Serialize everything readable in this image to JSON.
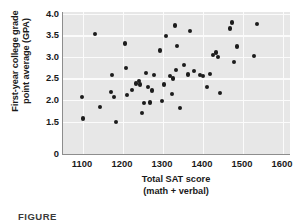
{
  "chart_data": {
    "type": "scatter",
    "title": "",
    "xlabel": "Total SAT score (math + verbal)",
    "xlabel_line1": "Total SAT score",
    "xlabel_line2": "(math + verbal)",
    "ylabel": "First-year college grade point average (GPA)",
    "ylabel_line1": "First-year college grade",
    "ylabel_line2": "point average (GPA)",
    "xlim": [
      1050,
      1620
    ],
    "ylim": [
      0,
      4.0
    ],
    "y_axis_break": true,
    "grid": true,
    "grid_color": "#fbfbfb",
    "plot_background": "#e7e7e7",
    "point_color": "#1c1c1c",
    "legend": null,
    "xticks": [
      1100,
      1200,
      1300,
      1400,
      1500,
      1600
    ],
    "xticklabels": [
      "1100",
      "1200",
      "1300",
      "1400",
      "1500",
      "1600"
    ],
    "yticks": [
      0,
      1.5,
      2.0,
      2.5,
      3.0,
      3.5,
      4.0
    ],
    "yticklabels": [
      "0",
      "1.5",
      "2.0",
      "2.5",
      "3.0",
      "3.5",
      "4.0"
    ],
    "points": [
      [
        1098,
        2.07
      ],
      [
        1100,
        1.57
      ],
      [
        1130,
        3.53
      ],
      [
        1142,
        1.83
      ],
      [
        1170,
        2.18
      ],
      [
        1172,
        2.57
      ],
      [
        1178,
        2.06
      ],
      [
        1182,
        1.49
      ],
      [
        1205,
        3.31
      ],
      [
        1208,
        2.75
      ],
      [
        1210,
        2.11
      ],
      [
        1222,
        2.23
      ],
      [
        1232,
        2.38
      ],
      [
        1240,
        2.44
      ],
      [
        1243,
        2.36
      ],
      [
        1248,
        1.7
      ],
      [
        1252,
        1.93
      ],
      [
        1258,
        2.62
      ],
      [
        1262,
        2.31
      ],
      [
        1268,
        1.94
      ],
      [
        1272,
        2.22
      ],
      [
        1278,
        2.58
      ],
      [
        1292,
        3.15
      ],
      [
        1298,
        1.97
      ],
      [
        1302,
        2.36
      ],
      [
        1308,
        3.48
      ],
      [
        1318,
        2.56
      ],
      [
        1322,
        2.14
      ],
      [
        1325,
        2.5
      ],
      [
        1330,
        3.73
      ],
      [
        1332,
        2.7
      ],
      [
        1336,
        3.26
      ],
      [
        1342,
        1.81
      ],
      [
        1352,
        2.82
      ],
      [
        1362,
        2.59
      ],
      [
        1368,
        3.6
      ],
      [
        1378,
        2.68
      ],
      [
        1392,
        2.57
      ],
      [
        1400,
        2.56
      ],
      [
        1410,
        2.31
      ],
      [
        1418,
        2.6
      ],
      [
        1424,
        3.05
      ],
      [
        1432,
        3.1
      ],
      [
        1438,
        2.99
      ],
      [
        1442,
        2.16
      ],
      [
        1468,
        3.66
      ],
      [
        1472,
        3.8
      ],
      [
        1478,
        2.89
      ],
      [
        1484,
        3.24
      ],
      [
        1528,
        3.02
      ],
      [
        1535,
        3.77
      ]
    ]
  },
  "caption": {
    "text": "FIGURE"
  }
}
